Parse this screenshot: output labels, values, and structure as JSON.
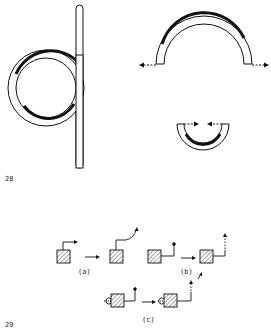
{
  "figures": [
    {
      "number": "28",
      "parts": [
        {
          "name": "coiled-rod",
          "description": "straight rod with circular loop, thickened outer arc"
        },
        {
          "name": "open-arch",
          "description": "semicircular arch with outward dashed arrows"
        },
        {
          "name": "closed-cup",
          "description": "small U-shaped cup with inward dashed arrows"
        }
      ]
    },
    {
      "number": "29",
      "subfigures": [
        {
          "label": "(a)"
        },
        {
          "label": "(b)"
        },
        {
          "label": "(c)"
        }
      ]
    }
  ],
  "colors": {
    "ink": "#111111",
    "background": "#ffffff"
  }
}
